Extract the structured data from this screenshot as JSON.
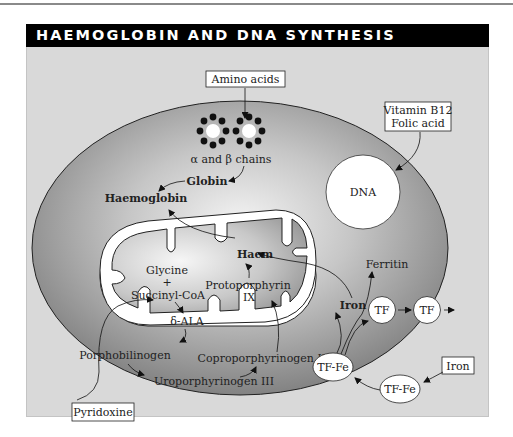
{
  "title": "HAEMOGLOBIN AND DNA SYNTHESIS",
  "colors": {
    "panel_bg": "#d9d9d9",
    "title_bg": "#000000",
    "title_text": "#ffffff",
    "cell_dark": "#8c8c8c",
    "cell_light": "#f2f2f2",
    "outline": "#222222",
    "white": "#ffffff"
  },
  "boxes": {
    "amino_acids": "Amino acids",
    "vitamin_line1": "Vitamin B12",
    "vitamin_line2": "Folic acid",
    "pyridoxine": "Pyridoxine",
    "iron_external": "Iron"
  },
  "labels": {
    "chains": "α and β chains",
    "globin": "Globin",
    "haemoglobin": "Haemoglobin",
    "dna": "DNA",
    "haem": "Haem",
    "glycine": "Glycine",
    "plus": "+",
    "succinyl_coa": "Succinyl-CoA",
    "delta_ala": "δ-ALA",
    "protoporphyrin_line1": "Protoporphyrin",
    "protoporphyrin_line2": "IX",
    "porphobilinogen": "Porphobilinogen",
    "uroporphyrinogen": "Uroporphyrinogen III",
    "coproporphyrinogen": "Coproporphyrinogen III",
    "iron_internal": "Iron",
    "ferritin": "Ferritin"
  },
  "nodes": {
    "tf_1": "TF",
    "tf_2": "TF",
    "tf_fe_internal": "TF-Fe",
    "tf_fe_external": "TF-Fe"
  }
}
